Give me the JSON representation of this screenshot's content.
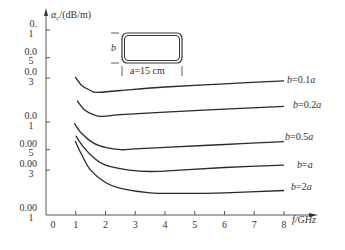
{
  "chart_data": {
    "type": "line",
    "title": "",
    "xlabel": "f/GHz",
    "ylabel": "αc/(dB/m)",
    "xlim": [
      0,
      8
    ],
    "ylim": [
      0.001,
      0.1
    ],
    "yscale": "log",
    "grid": false,
    "x_ticks": [
      "0",
      "1",
      "2",
      "3",
      "4",
      "5",
      "6",
      "7",
      "8"
    ],
    "y_ticks": [
      {
        "value": 0.1,
        "label_lines": [
          "0.",
          "1"
        ]
      },
      {
        "value": 0.05,
        "label_lines": [
          "0.0",
          "5"
        ]
      },
      {
        "value": 0.03,
        "label_lines": [
          "0.0",
          "3"
        ]
      },
      {
        "value": 0.01,
        "label_lines": [
          "0.0",
          "1"
        ]
      },
      {
        "value": 0.005,
        "label_lines": [
          "0.00",
          "5"
        ]
      },
      {
        "value": 0.003,
        "label_lines": [
          "0.00",
          "3"
        ]
      },
      {
        "value": 0.001,
        "label_lines": [
          "0.00",
          "1"
        ]
      }
    ],
    "series": [
      {
        "name": "b=0.1a",
        "label": "b=0.1a",
        "x": [
          0.98,
          1.2,
          1.5,
          1.7,
          2.5,
          4,
          6,
          8
        ],
        "y": [
          0.031,
          0.025,
          0.022,
          0.021,
          0.022,
          0.024,
          0.026,
          0.028
        ]
      },
      {
        "name": "b=0.2a",
        "label": "b=0.2a",
        "x": [
          1.05,
          1.3,
          1.6,
          1.85,
          2.5,
          4,
          6,
          8
        ],
        "y": [
          0.017,
          0.0135,
          0.012,
          0.0115,
          0.012,
          0.0128,
          0.0138,
          0.0148
        ]
      },
      {
        "name": "b=0.5a",
        "label": "b=0.5a",
        "x": [
          0.95,
          1.2,
          1.6,
          2.0,
          2.5,
          3.0,
          4,
          6,
          8
        ],
        "y": [
          0.0097,
          0.0075,
          0.0059,
          0.0053,
          0.005,
          0.0051,
          0.0053,
          0.0057,
          0.0061
        ]
      },
      {
        "name": "b=a",
        "label": "b=a",
        "x": [
          1.0,
          1.25,
          1.6,
          2.0,
          2.8,
          3.5,
          4.5,
          6,
          8
        ],
        "y": [
          0.0071,
          0.0054,
          0.0041,
          0.0034,
          0.003,
          0.0029,
          0.003,
          0.0032,
          0.0034
        ]
      },
      {
        "name": "b=2a",
        "label": "b=2a",
        "x": [
          0.98,
          1.2,
          1.5,
          2.0,
          2.5,
          3.5,
          4.5,
          6,
          8
        ],
        "y": [
          0.0062,
          0.0044,
          0.003,
          0.0022,
          0.0019,
          0.0017,
          0.00168,
          0.0017,
          0.0018
        ]
      }
    ],
    "annotations": [
      {
        "text": "b",
        "role": "waveguide height label"
      },
      {
        "text": "a=15 cm",
        "role": "waveguide width label"
      }
    ]
  },
  "axes": {
    "ylabel_prefix": "α",
    "ylabel_sub": "c",
    "ylabel_suffix": "/(dB/m)",
    "xlabel": "f/GHz"
  },
  "inset": {
    "height_label": "b",
    "width_label": "a=15 cm"
  },
  "colors": {
    "line": "#2a2a2a",
    "axis": "#555555"
  }
}
